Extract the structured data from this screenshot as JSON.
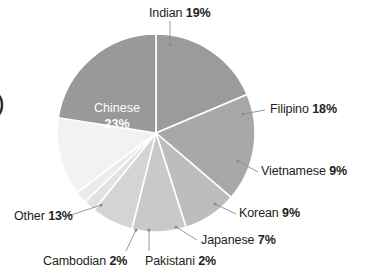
{
  "chart_data": {
    "type": "pie",
    "title": "",
    "categories": [
      "Indian",
      "Filipino",
      "Vietnamese",
      "Korean",
      "Japanese",
      "Pakistani",
      "Cambodian",
      "Other",
      "Chinese"
    ],
    "values": [
      19,
      18,
      9,
      9,
      7,
      2,
      2,
      13,
      23
    ],
    "unit": "%",
    "legend": "callout-labels",
    "grid": false,
    "slice_colors": [
      "#9b9b9b",
      "#a8a8a8",
      "#bdbdbd",
      "#c9c9c9",
      "#d4d4d4",
      "#e2e2e2",
      "#ebebeb",
      "#f2f2f2",
      "#999999"
    ],
    "inner_label_index": 8,
    "labels": [
      {
        "name": "Indian",
        "pct": "19%",
        "color": "#231f20"
      },
      {
        "name": "Filipino",
        "pct": "18%",
        "color": "#231f20"
      },
      {
        "name": "Vietnamese",
        "pct": "9%",
        "color": "#231f20"
      },
      {
        "name": "Korean",
        "pct": "9%",
        "color": "#231f20"
      },
      {
        "name": "Japanese",
        "pct": "7%",
        "color": "#231f20"
      },
      {
        "name": "Pakistani",
        "pct": "2%",
        "color": "#231f20"
      },
      {
        "name": "Cambodian",
        "pct": "2%",
        "color": "#231f20"
      },
      {
        "name": "Other",
        "pct": "13%",
        "color": "#231f20"
      },
      {
        "name": "Chinese",
        "pct": "23%",
        "color": "#ffffff"
      }
    ]
  },
  "edge_glyph": ")"
}
